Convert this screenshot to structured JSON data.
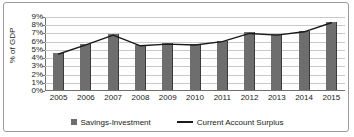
{
  "chart_data": {
    "type": "bar",
    "title": "",
    "xlabel": "",
    "ylabel": "% of GDP",
    "ylim": [
      0,
      9
    ],
    "ytick_labels": [
      "9%",
      "8%",
      "7%",
      "6%",
      "5%",
      "4%",
      "3%",
      "2%",
      "1%",
      "0%"
    ],
    "ytick_values": [
      9,
      8,
      7,
      6,
      5,
      4,
      3,
      2,
      1,
      0
    ],
    "grid": true,
    "legend_position": "bottom",
    "categories": [
      "2005",
      "2006",
      "2007",
      "2008",
      "2009",
      "2010",
      "2011",
      "2012",
      "2013",
      "2014",
      "2015"
    ],
    "series": [
      {
        "name": "Savings-Investment",
        "type": "bar",
        "color": "#6e6e6e",
        "values": [
          4.5,
          5.6,
          6.8,
          5.5,
          5.7,
          5.6,
          6.0,
          7.0,
          6.8,
          7.2,
          8.3
        ]
      },
      {
        "name": "Current Account Surplus",
        "type": "line",
        "color": "#1a1a1a",
        "values": [
          4.5,
          5.6,
          6.8,
          5.5,
          5.7,
          5.6,
          6.0,
          7.0,
          6.8,
          7.2,
          8.3
        ]
      }
    ]
  },
  "legend": {
    "items": [
      {
        "label": "Savings-Investment",
        "marker": "square-swatch-icon"
      },
      {
        "label": "Current Account Surplus",
        "marker": "line-swatch-icon"
      }
    ]
  }
}
